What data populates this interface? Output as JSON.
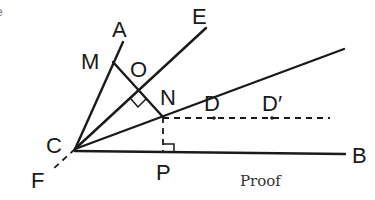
{
  "diagram": {
    "type": "geometry-construction",
    "caption": "Proof",
    "points": {
      "C": {
        "label": "C",
        "x": 75,
        "y": 149
      },
      "A": {
        "label": "A",
        "x": 123,
        "y": 42
      },
      "E": {
        "label": "E",
        "x": 206,
        "y": 28
      },
      "M": {
        "label": "M",
        "x": 113,
        "y": 62
      },
      "O": {
        "label": "O",
        "x": 139,
        "y": 91
      },
      "N": {
        "label": "N",
        "x": 163,
        "y": 117
      },
      "D": {
        "label": "D",
        "x": 214,
        "y": 97
      },
      "D_prime": {
        "label": "D′",
        "x": 272,
        "y": 118
      },
      "P": {
        "label": "P",
        "x": 163,
        "y": 152
      },
      "B": {
        "label": "B",
        "x": 345,
        "y": 154
      },
      "F": {
        "label": "F",
        "x": 50,
        "y": 172
      }
    },
    "segments": [
      {
        "from": "C",
        "to": "A",
        "style": "solid"
      },
      {
        "from": "C",
        "to": "E",
        "style": "solid"
      },
      {
        "from": "C",
        "to": "D",
        "style": "solid",
        "extends_to": [
          344,
          49
        ]
      },
      {
        "from": "C",
        "to": "B",
        "style": "solid"
      },
      {
        "from": "M",
        "to": "N",
        "style": "solid"
      },
      {
        "from": "C",
        "to": "F",
        "style": "dashed"
      },
      {
        "from": "N",
        "to": "P",
        "style": "dashed"
      },
      {
        "from": "N",
        "to": "D_prime",
        "style": "dashed",
        "extends_to": [
          330,
          118
        ]
      }
    ],
    "right_angles": [
      "O",
      "P"
    ],
    "edge_fragments": [
      "e",
      "r"
    ]
  }
}
